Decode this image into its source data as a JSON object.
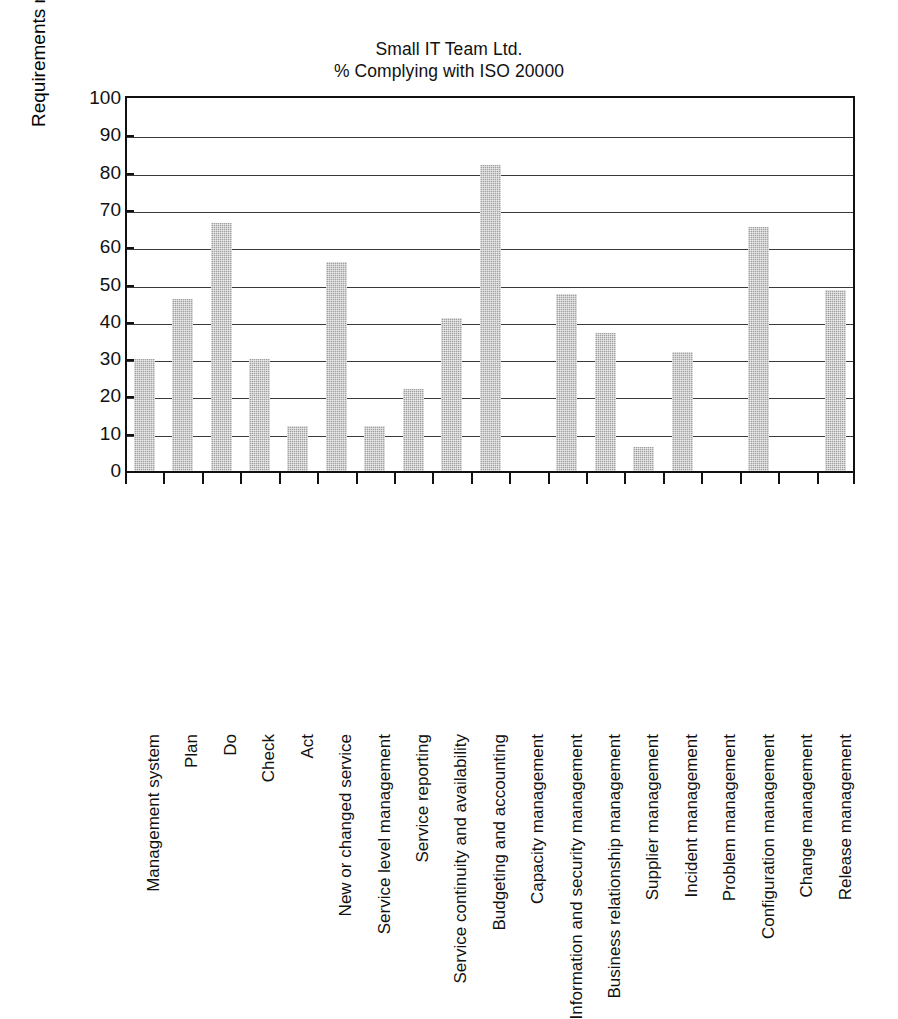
{
  "chart_data": {
    "type": "bar",
    "title": "Small IT Team Ltd.",
    "subtitle": "% Complying with ISO 20000",
    "xlabel": "",
    "ylabel": "Requirements met (%)",
    "ylim": [
      0,
      100
    ],
    "ytick_step": 10,
    "yticks": [
      0,
      10,
      20,
      30,
      40,
      50,
      60,
      70,
      80,
      90,
      100
    ],
    "grid": "horizontal",
    "legend": "none",
    "bar_color": "#a0a0a0",
    "categories": [
      "Management system",
      "Plan",
      "Do",
      "Check",
      "Act",
      "New or changed service",
      "Service level management",
      "Service reporting",
      "Service continuity and availability",
      "Budgeting and accounting",
      "Capacity management",
      "Information and security management",
      "Business relationship management",
      "Supplier management",
      "Incident management",
      "Problem management",
      "Configuration management",
      "Change management",
      "Release management"
    ],
    "values": [
      30,
      46,
      66.5,
      30,
      12,
      56,
      12,
      22,
      41,
      82,
      0,
      47.5,
      37,
      6.5,
      32,
      0,
      65.5,
      0,
      48.5
    ]
  }
}
